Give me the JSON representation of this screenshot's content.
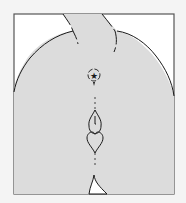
{
  "diagram": {
    "type": "line-illustration",
    "colors": {
      "background": "#f4f4f4",
      "frame_fill": "#ffffff",
      "frame_stroke": "#555555",
      "body_fill": "#dcdcdc",
      "outline": "#1a1a1a"
    },
    "markers": [
      {
        "name": "star-mark",
        "glyph": "★"
      },
      {
        "name": "heart-shape",
        "glyph": "heart"
      },
      {
        "name": "teardrop-shape",
        "glyph": "drop"
      }
    ]
  }
}
